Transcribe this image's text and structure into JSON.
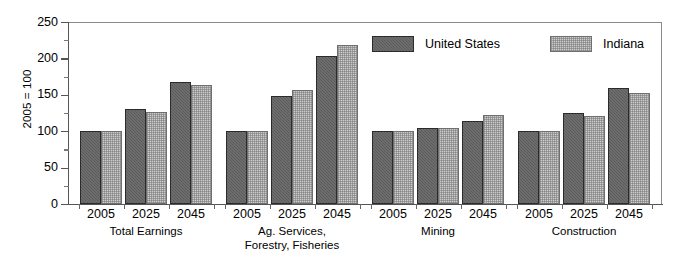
{
  "chart_data": {
    "type": "bar",
    "title": "",
    "subtitle": "",
    "xlabel": "",
    "ylabel": "2005 = 100",
    "ylim": [
      0,
      250
    ],
    "ytick_values": [
      0,
      50,
      100,
      150,
      200,
      250
    ],
    "ytick_labels": [
      "0",
      "50",
      "100",
      "150",
      "200",
      "250"
    ],
    "yminor_tick_values": [
      25,
      75,
      125,
      175,
      225
    ],
    "grid": false,
    "legend_position": "top-center-right",
    "x": [
      "2005",
      "2025",
      "2045"
    ],
    "groups": [
      {
        "name": "Total Earnings",
        "name_lines": [
          "Total Earnings"
        ],
        "years": [
          "2005",
          "2025",
          "2045"
        ]
      },
      {
        "name": "Ag. Services, Forestry, Fisheries",
        "name_lines": [
          "Ag. Services,",
          "Forestry, Fisheries"
        ],
        "years": [
          "2005",
          "2025",
          "2045"
        ]
      },
      {
        "name": "Mining",
        "name_lines": [
          "Mining"
        ],
        "years": [
          "2005",
          "2025",
          "2045"
        ]
      },
      {
        "name": "Construction",
        "name_lines": [
          "Construction"
        ],
        "years": [
          "2005",
          "2025",
          "2045"
        ]
      }
    ],
    "series": [
      {
        "name": "United States",
        "color": "#5b5b5b",
        "values_by_group": {
          "Total Earnings": [
            100,
            130,
            168
          ],
          "Ag. Services, Forestry, Fisheries": [
            100,
            149,
            204
          ],
          "Mining": [
            100,
            104,
            114
          ],
          "Construction": [
            100,
            125,
            159
          ]
        }
      },
      {
        "name": "Indiana",
        "color": "#cdcdcd",
        "values_by_group": {
          "Total Earnings": [
            100,
            126,
            163
          ],
          "Ag. Services, Forestry, Fisheries": [
            100,
            156,
            219
          ],
          "Mining": [
            100,
            105,
            122
          ],
          "Construction": [
            100,
            121,
            153
          ]
        }
      }
    ]
  },
  "legend": {
    "entries": [
      {
        "label": "United States",
        "swatch": "us"
      },
      {
        "label": "Indiana",
        "swatch": "in"
      }
    ]
  },
  "colors": {
    "united_states": "#5b5b5b",
    "indiana": "#cdcdcd",
    "axis": "#555555",
    "frame": "#8a8a8a",
    "text": "#000000",
    "background": "#ffffff"
  }
}
